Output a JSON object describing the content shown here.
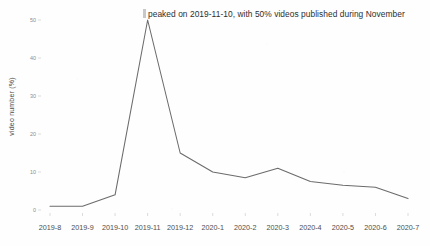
{
  "chart_data": {
    "type": "line",
    "title": "",
    "subtitle": "",
    "xlabel": "",
    "ylabel": "video number (%)",
    "categories": [
      "2019-8",
      "2019-9",
      "2019-10",
      "2019-11",
      "2019-12",
      "2020-1",
      "2020-2",
      "2020-3",
      "2020-4",
      "2020-5",
      "2020-6",
      "2020-7"
    ],
    "values": [
      1,
      1,
      4,
      50,
      15,
      10,
      8.5,
      11,
      7.5,
      6.5,
      6,
      3
    ],
    "series": [
      {
        "name": "video number (%)",
        "values": [
          1,
          1,
          4,
          50,
          15,
          10,
          8.5,
          11,
          7.5,
          6.5,
          6,
          3
        ]
      }
    ],
    "ylim": [
      0,
      50
    ],
    "yticks": [
      0,
      10,
      20,
      30,
      40,
      50
    ],
    "ytick_labels": [
      "0",
      "10",
      "20",
      "30",
      "40",
      "50"
    ],
    "grid": false,
    "legend": "none",
    "annotations": [
      {
        "text": "peaked on 2019-11-10,  with 50% videos published during November",
        "anchor_category": "2019-11"
      }
    ],
    "line_color": "#6b6b6b",
    "background_color": "#fefefe",
    "tick_color": "#8c8c8c",
    "axis_label_color": "#4d4d4d"
  }
}
